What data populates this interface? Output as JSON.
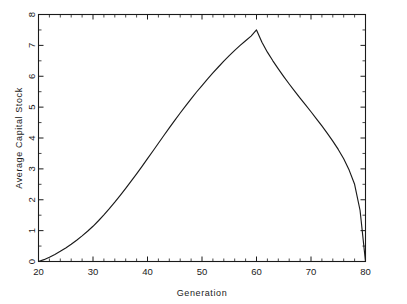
{
  "chart_data": {
    "type": "line",
    "title": "",
    "xlabel": "Generation",
    "ylabel": "Average Capital Stock",
    "xlim": [
      20,
      80
    ],
    "ylim": [
      0,
      8
    ],
    "grid": false,
    "legend": null,
    "x_ticks": [
      20,
      30,
      40,
      50,
      60,
      70,
      80
    ],
    "x_tick_labels": [
      "20",
      "30",
      "40",
      "50",
      "60",
      "70",
      "80"
    ],
    "x_minor_interval": 2,
    "y_ticks": [
      0,
      1,
      2,
      3,
      4,
      5,
      6,
      7,
      8
    ],
    "y_tick_labels": [
      "0",
      "1",
      "2",
      "3",
      "4",
      "5",
      "6",
      "7",
      "8"
    ],
    "y_minor_interval": 0.5,
    "line_color": "#1a1a1a",
    "background_color": "#ffffff",
    "series": [
      {
        "name": "Average Capital Stock",
        "x": [
          20,
          21,
          22,
          23,
          24,
          25,
          26,
          27,
          28,
          29,
          30,
          31,
          32,
          33,
          34,
          35,
          36,
          37,
          38,
          39,
          40,
          41,
          42,
          43,
          44,
          45,
          46,
          47,
          48,
          49,
          50,
          51,
          52,
          53,
          54,
          55,
          56,
          57,
          58,
          59,
          60,
          61,
          62,
          63,
          64,
          65,
          66,
          67,
          68,
          69,
          70,
          71,
          72,
          73,
          74,
          75,
          76,
          77,
          78,
          79,
          80
        ],
        "y": [
          0.0,
          0.06,
          0.14,
          0.23,
          0.33,
          0.44,
          0.56,
          0.69,
          0.83,
          0.98,
          1.14,
          1.32,
          1.51,
          1.71,
          1.92,
          2.14,
          2.37,
          2.6,
          2.84,
          3.08,
          3.33,
          3.58,
          3.83,
          4.08,
          4.33,
          4.57,
          4.81,
          5.04,
          5.27,
          5.49,
          5.7,
          5.91,
          6.11,
          6.3,
          6.49,
          6.67,
          6.84,
          7.0,
          7.15,
          7.3,
          7.5,
          7.1,
          6.78,
          6.5,
          6.24,
          5.99,
          5.75,
          5.52,
          5.29,
          5.07,
          4.85,
          4.62,
          4.39,
          4.15,
          3.9,
          3.63,
          3.33,
          2.96,
          2.5,
          1.66,
          0.0
        ]
      }
    ]
  }
}
